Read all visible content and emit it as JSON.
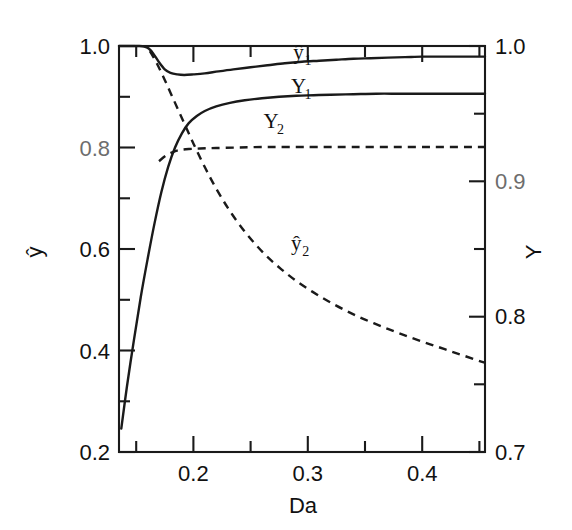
{
  "chart_data": {
    "type": "line",
    "title": "",
    "xlabel": "Da",
    "ylabel_left": "ŷ",
    "ylabel_right": "Y",
    "xlim": [
      0.135,
      0.455
    ],
    "ylim_left": [
      0.2,
      1.0
    ],
    "ylim_right": [
      0.7,
      1.0
    ],
    "grid": false,
    "legend_position": "inline-curve-labels",
    "xticks": [
      0.2,
      0.3,
      0.4
    ],
    "xtick_labels": [
      "0.2",
      "0.3",
      "0.4"
    ],
    "xticks_minor": [
      0.15,
      0.25,
      0.35,
      0.45
    ],
    "yticks_left": [
      0.2,
      0.4,
      0.6,
      0.8,
      1.0
    ],
    "ytick_labels_left": [
      "0.2",
      "0.4",
      "0.6",
      "0.8",
      "1.0"
    ],
    "yticks_left_minor": [
      0.3,
      0.5,
      0.7,
      0.9
    ],
    "yticks_right": [
      0.7,
      0.8,
      0.9,
      1.0
    ],
    "ytick_labels_right": [
      "0.7",
      "0.8",
      "0.9",
      "1.0"
    ],
    "yticks_right_minor": [
      0.75,
      0.85,
      0.95
    ],
    "series": [
      {
        "name": "y-hat-1",
        "label": "ŷ",
        "label_subscript": "1",
        "style": "solid",
        "axis": "left",
        "label_x": 0.292,
        "label_y": 0.975,
        "points": [
          [
            0.135,
            1.0
          ],
          [
            0.145,
            1.0
          ],
          [
            0.152,
            1.0
          ],
          [
            0.157,
            0.999
          ],
          [
            0.161,
            0.995
          ],
          [
            0.165,
            0.985
          ],
          [
            0.17,
            0.968
          ],
          [
            0.175,
            0.954
          ],
          [
            0.18,
            0.947
          ],
          [
            0.186,
            0.944
          ],
          [
            0.192,
            0.943
          ],
          [
            0.2,
            0.944
          ],
          [
            0.21,
            0.946
          ],
          [
            0.222,
            0.95
          ],
          [
            0.235,
            0.954
          ],
          [
            0.25,
            0.958
          ],
          [
            0.265,
            0.962
          ],
          [
            0.28,
            0.966
          ],
          [
            0.295,
            0.969
          ],
          [
            0.31,
            0.971
          ],
          [
            0.325,
            0.973
          ],
          [
            0.34,
            0.975
          ],
          [
            0.355,
            0.976
          ],
          [
            0.37,
            0.977
          ],
          [
            0.385,
            0.978
          ],
          [
            0.4,
            0.979
          ],
          [
            0.415,
            0.979
          ],
          [
            0.43,
            0.979
          ],
          [
            0.445,
            0.979
          ],
          [
            0.455,
            0.979
          ]
        ]
      },
      {
        "name": "Y-1-solid",
        "label": "Y",
        "label_subscript": "1",
        "style": "solid",
        "axis": "left",
        "label_x": 0.292,
        "label_y": 0.908,
        "points": [
          [
            0.137,
            0.246
          ],
          [
            0.142,
            0.33
          ],
          [
            0.148,
            0.42
          ],
          [
            0.154,
            0.505
          ],
          [
            0.16,
            0.58
          ],
          [
            0.166,
            0.65
          ],
          [
            0.172,
            0.712
          ],
          [
            0.178,
            0.762
          ],
          [
            0.184,
            0.8
          ],
          [
            0.19,
            0.828
          ],
          [
            0.196,
            0.848
          ],
          [
            0.203,
            0.862
          ],
          [
            0.21,
            0.872
          ],
          [
            0.22,
            0.881
          ],
          [
            0.232,
            0.888
          ],
          [
            0.245,
            0.893
          ],
          [
            0.26,
            0.897
          ],
          [
            0.275,
            0.9
          ],
          [
            0.29,
            0.902
          ],
          [
            0.305,
            0.903
          ],
          [
            0.32,
            0.904
          ],
          [
            0.34,
            0.905
          ],
          [
            0.36,
            0.906
          ],
          [
            0.38,
            0.906
          ],
          [
            0.4,
            0.906
          ],
          [
            0.42,
            0.906
          ],
          [
            0.44,
            0.906
          ],
          [
            0.455,
            0.906
          ]
        ]
      },
      {
        "name": "Y-2-dashed",
        "label": "Y",
        "label_subscript": "2",
        "style": "dashed",
        "axis": "left",
        "label_x": 0.268,
        "label_y": 0.838,
        "points": [
          [
            0.17,
            0.773
          ],
          [
            0.176,
            0.784
          ],
          [
            0.182,
            0.791
          ],
          [
            0.188,
            0.795
          ],
          [
            0.196,
            0.797
          ],
          [
            0.206,
            0.798
          ],
          [
            0.22,
            0.799
          ],
          [
            0.24,
            0.8
          ],
          [
            0.262,
            0.801
          ],
          [
            0.285,
            0.801
          ],
          [
            0.31,
            0.801
          ],
          [
            0.34,
            0.801
          ],
          [
            0.375,
            0.801
          ],
          [
            0.41,
            0.801
          ],
          [
            0.44,
            0.801
          ],
          [
            0.455,
            0.801
          ]
        ]
      },
      {
        "name": "y-hat-2-dashed",
        "label": "ŷ",
        "label_subscript": "2",
        "style": "dashed",
        "axis": "left",
        "label_x": 0.29,
        "label_y": 0.598,
        "points": [
          [
            0.162,
            0.99
          ],
          [
            0.168,
            0.966
          ],
          [
            0.174,
            0.938
          ],
          [
            0.18,
            0.908
          ],
          [
            0.186,
            0.878
          ],
          [
            0.192,
            0.848
          ],
          [
            0.198,
            0.818
          ],
          [
            0.204,
            0.789
          ],
          [
            0.211,
            0.757
          ],
          [
            0.218,
            0.727
          ],
          [
            0.226,
            0.696
          ],
          [
            0.234,
            0.668
          ],
          [
            0.244,
            0.637
          ],
          [
            0.254,
            0.61
          ],
          [
            0.265,
            0.584
          ],
          [
            0.277,
            0.56
          ],
          [
            0.29,
            0.537
          ],
          [
            0.304,
            0.516
          ],
          [
            0.318,
            0.497
          ],
          [
            0.333,
            0.479
          ],
          [
            0.348,
            0.463
          ],
          [
            0.364,
            0.448
          ],
          [
            0.38,
            0.434
          ],
          [
            0.397,
            0.42
          ],
          [
            0.414,
            0.407
          ],
          [
            0.431,
            0.394
          ],
          [
            0.448,
            0.381
          ],
          [
            0.455,
            0.376
          ]
        ]
      }
    ]
  },
  "axes": {
    "x_title": "Da",
    "y_left_title": "ŷ",
    "y_right_title": "Y"
  },
  "tick_text": {
    "left": [
      "1.0",
      "0.8",
      "0.6",
      "0.4",
      "0.2"
    ],
    "right": [
      "1.0",
      "0.9",
      "0.8",
      "0.7"
    ],
    "bottom": [
      "0.2",
      "0.3",
      "0.4"
    ]
  }
}
